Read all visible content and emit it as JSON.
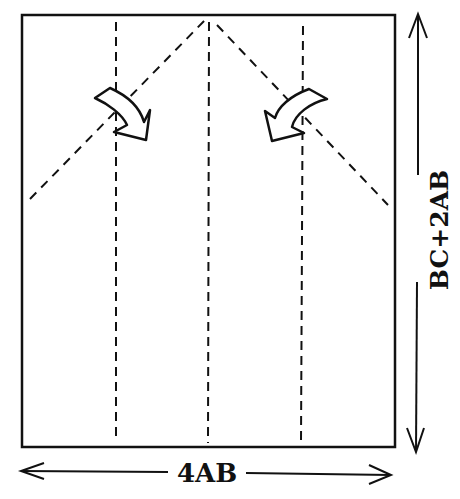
{
  "diagram": {
    "colors": {
      "ink": "#111111",
      "paper": "#ffffff"
    },
    "sheet": {
      "x": 22,
      "y": 15,
      "width": 373,
      "height": 432
    },
    "fold_lines": {
      "vertical": [
        {
          "x": 116,
          "y1": 22,
          "y2": 437
        },
        {
          "x": 209,
          "y1": 22,
          "y2": 443
        },
        {
          "x": 302,
          "y1": 26,
          "y2": 443
        }
      ],
      "diagonal": [
        {
          "x1": 30,
          "y1": 199,
          "x2": 205,
          "y2": 20
        },
        {
          "x1": 217,
          "y1": 25,
          "x2": 388,
          "y2": 205
        }
      ]
    },
    "fold_arrows": [
      {
        "name": "fold-arrow-left",
        "direction": "down-right"
      },
      {
        "name": "fold-arrow-right",
        "direction": "down-left"
      }
    ],
    "dimensions": {
      "width_label": "4AB",
      "height_label": "BC+2AB"
    }
  }
}
